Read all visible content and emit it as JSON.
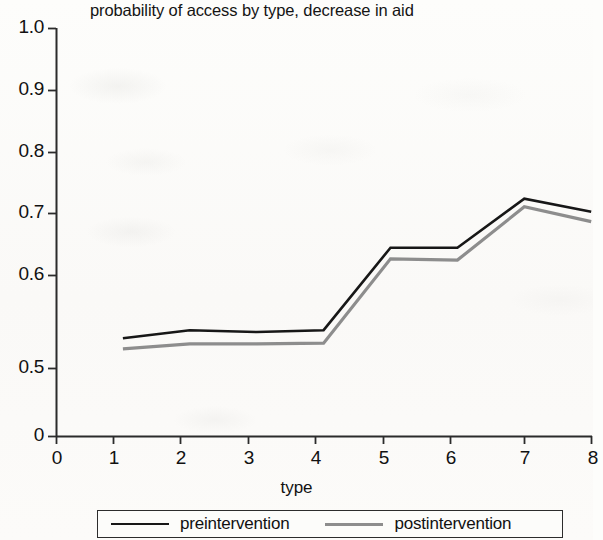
{
  "chart_data": {
    "type": "line",
    "title": "probability of access by type, decrease in aid",
    "xlabel": "type",
    "ylabel": "",
    "x": [
      1,
      2,
      3,
      4,
      5,
      6,
      7,
      8
    ],
    "xticks": [
      "0",
      "1",
      "2",
      "3",
      "4",
      "5",
      "6",
      "7",
      "8"
    ],
    "yticks": [
      "0",
      "0.5",
      "0.6",
      "0.7",
      "0.8",
      "0.9",
      "1.0"
    ],
    "xlim": [
      0,
      8
    ],
    "ylim": [
      0,
      1.0
    ],
    "y_axis_break": "axis jumps from 0 to 0.5; above 0.5 the scale is linear in 0.1 steps",
    "grid": false,
    "legend_position": "bottom",
    "series": [
      {
        "name": "preintervention",
        "color": "#171717",
        "values": [
          0.548,
          0.561,
          0.558,
          0.561,
          0.694,
          0.694,
          0.773,
          0.752
        ]
      },
      {
        "name": "postintervention",
        "color": "#8d8d8d",
        "values": [
          0.531,
          0.539,
          0.539,
          0.54,
          0.676,
          0.674,
          0.76,
          0.736
        ]
      }
    ]
  },
  "legend": {
    "entries": [
      {
        "label": "preintervention"
      },
      {
        "label": "postintervention"
      }
    ]
  },
  "axis_title": {
    "x": "type"
  }
}
